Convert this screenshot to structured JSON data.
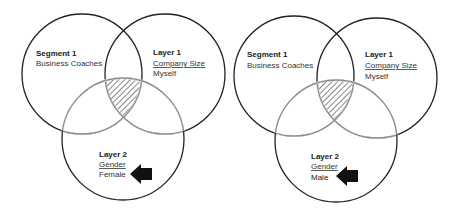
{
  "diagrams": [
    {
      "segment": {
        "title": "Segment 1",
        "value": "Business Coaches"
      },
      "layer1": {
        "title": "Layer 1",
        "attribute": "Company Size",
        "value": "Myself"
      },
      "layer2": {
        "title": "Layer 2",
        "attribute": "Gender",
        "value": "Female"
      },
      "highlight": "triple-intersection",
      "arrow": "left-pointing-arrow"
    },
    {
      "segment": {
        "title": "Segment 1",
        "value": "Business Coaches"
      },
      "layer1": {
        "title": "Layer 1",
        "attribute": "Company Size",
        "value": "Myself"
      },
      "layer2": {
        "title": "Layer 2",
        "attribute": "Gender",
        "value": "Male"
      },
      "highlight": "triple-intersection",
      "arrow": "left-pointing-arrow"
    }
  ],
  "colors": {
    "outline": "#222222",
    "inner_outline": "#8a8a8a",
    "hatch": "#555555",
    "arrow": "#111111"
  }
}
